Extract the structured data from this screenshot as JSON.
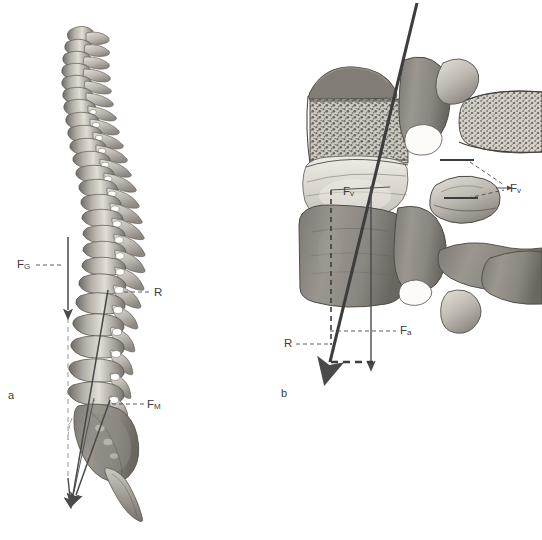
{
  "figure": {
    "background_color": "#ffffff",
    "ink_color": "#3c3c3c",
    "bone_light": "#d8d4cc",
    "bone_mid": "#9e9a92",
    "bone_dark": "#6d6a64",
    "vector_color": "#4a4a4a"
  },
  "panels": [
    {
      "id": "a",
      "label": "a",
      "name": "lateral-spine-panel",
      "description": "Lateral view of the whole vertebral column with sacrum and coccyx",
      "labels": [
        {
          "id": "FG",
          "symbol": "F",
          "subscript": "G",
          "text": "FG",
          "meaning": "weight / gravitational force",
          "x": 18,
          "y": 259
        },
        {
          "id": "R",
          "symbol": "R",
          "subscript": "",
          "text": "R",
          "meaning": "resultant force",
          "x": 155,
          "y": 288
        },
        {
          "id": "FM",
          "symbol": "F",
          "subscript": "M",
          "text": "FM",
          "meaning": "muscle force",
          "x": 148,
          "y": 400
        }
      ]
    },
    {
      "id": "b",
      "label": "b",
      "name": "lumbar-vertebra-panel",
      "description": "Midsagittal section of two lumbar vertebrae with intervertebral disc and facet joints",
      "labels": [
        {
          "id": "Fv-disc",
          "symbol": "F",
          "subscript": "v",
          "text": "Fv",
          "meaning": "vertical compressive component on disc",
          "x": 344,
          "y": 186
        },
        {
          "id": "Fv-facet",
          "symbol": "F",
          "subscript": "v",
          "text": "Fv",
          "meaning": "vertical component on facet joints",
          "x": 513,
          "y": 188
        },
        {
          "id": "Fa",
          "symbol": "F",
          "subscript": "a",
          "text": "Fa",
          "meaning": "axial force",
          "x": 402,
          "y": 326
        },
        {
          "id": "R",
          "symbol": "R",
          "subscript": "",
          "text": "R",
          "meaning": "resultant force",
          "x": 286,
          "y": 339
        }
      ]
    }
  ],
  "caption": {
    "visible_text": ""
  }
}
